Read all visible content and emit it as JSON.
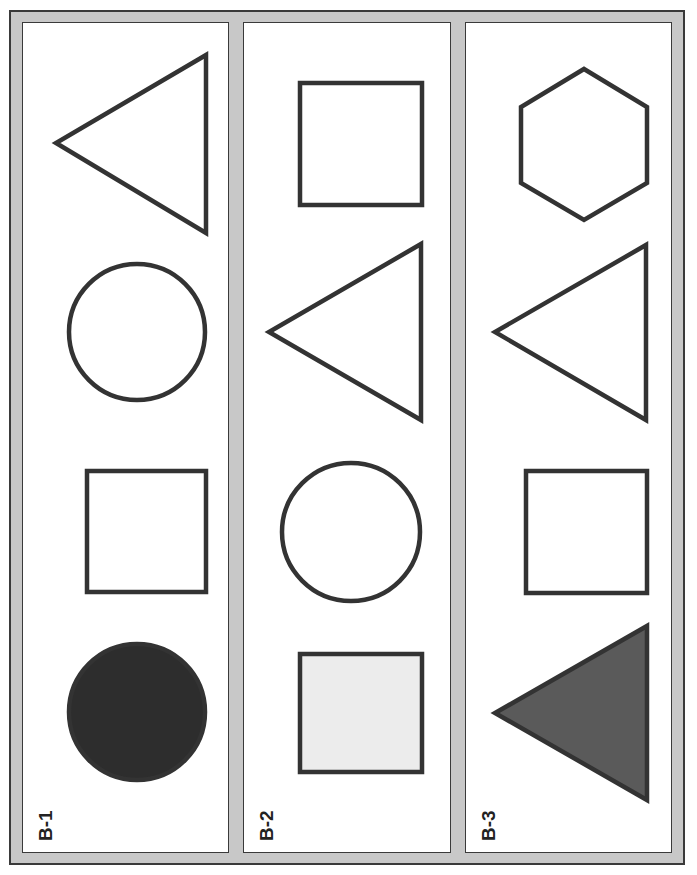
{
  "sheet": {
    "colors": {
      "border_band": "#c8c8c8",
      "outline": "#333333",
      "panel_bg": "#ffffff",
      "fill_dark": "#2d2d2d",
      "fill_mid": "#5a5a5a",
      "fill_light": "#ececec"
    },
    "panels": [
      {
        "label": "B-1",
        "shapes": [
          {
            "type": "triangle",
            "orientation": "left",
            "fill": "none"
          },
          {
            "type": "circle",
            "fill": "none"
          },
          {
            "type": "square",
            "fill": "none"
          },
          {
            "type": "circle",
            "fill": "dark"
          }
        ]
      },
      {
        "label": "B-2",
        "shapes": [
          {
            "type": "square",
            "fill": "none"
          },
          {
            "type": "triangle",
            "orientation": "left",
            "fill": "none"
          },
          {
            "type": "circle",
            "fill": "none"
          },
          {
            "type": "square",
            "fill": "light"
          }
        ]
      },
      {
        "label": "B-3",
        "shapes": [
          {
            "type": "hexagon",
            "fill": "none"
          },
          {
            "type": "triangle",
            "orientation": "left",
            "fill": "none"
          },
          {
            "type": "square",
            "fill": "none"
          },
          {
            "type": "triangle",
            "orientation": "left",
            "fill": "mid"
          }
        ]
      }
    ]
  }
}
